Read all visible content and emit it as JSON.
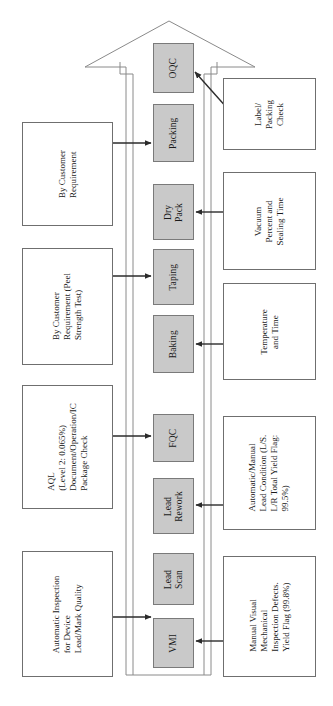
{
  "figure": {
    "type": "process-flow-diagram",
    "orientation": "text-rotated-90-ccw",
    "outer_shape": "upward-arrow-outline",
    "colors": {
      "process_fill": "#c9c9c9",
      "process_border": "#7a7a7a",
      "annotation_fill": "#ffffff",
      "annotation_border": "#6f6f6f",
      "line": "#4a4a4a",
      "background": "#ffffff"
    }
  },
  "process_steps": [
    {
      "id": "vmi",
      "label": "VMI"
    },
    {
      "id": "lead-scan",
      "label": "Lead\nScan"
    },
    {
      "id": "lead-rework",
      "label": "Lead\nRework"
    },
    {
      "id": "fqc",
      "label": "FQC"
    },
    {
      "id": "baking",
      "label": "Baking"
    },
    {
      "id": "taping",
      "label": "Taping"
    },
    {
      "id": "dry-pack",
      "label": "Dry\nPack"
    },
    {
      "id": "packing",
      "label": "Packing"
    },
    {
      "id": "oqc",
      "label": "OQC"
    }
  ],
  "left_annotations": [
    {
      "id": "automatic-inspection",
      "target": "lead-scan",
      "lines": [
        "Automatic Inspection",
        "for Device",
        "Lead/Mark Quality"
      ]
    },
    {
      "id": "aql",
      "target": "fqc",
      "lines": [
        "AQL",
        "(Level 2: 0.065%)",
        "Document/Operation/IC",
        "Package Check"
      ]
    },
    {
      "id": "peel-strength",
      "target": "taping",
      "lines": [
        "By Customer",
        "Requirement (Peel",
        "Strength Test)"
      ]
    },
    {
      "id": "customer-requirement",
      "target": "packing",
      "lines": [
        "By Customer",
        "Requirement"
      ]
    }
  ],
  "right_annotations": [
    {
      "id": "manual-visual",
      "target": "vmi",
      "lines": [
        "Manual Visual",
        "Mechanical",
        "Inspection Defects.",
        "Yield Flag (99.8%)"
      ]
    },
    {
      "id": "lead-condition",
      "target": "lead-rework",
      "lines": [
        "Automatic/Manual",
        "Lead Condition (L/S.",
        "L/R Total Yield Flag:",
        "99.5%)"
      ]
    },
    {
      "id": "temperature-time",
      "target": "baking",
      "lines": [
        "Temperature",
        "and Time"
      ]
    },
    {
      "id": "vacuum-sealing",
      "target": "dry-pack",
      "lines": [
        "Vacuum",
        "Percent and",
        "Sealing Time"
      ]
    },
    {
      "id": "label-packing-check",
      "target": "oqc",
      "lines": [
        "Label/",
        "Packing",
        "Check"
      ]
    }
  ]
}
